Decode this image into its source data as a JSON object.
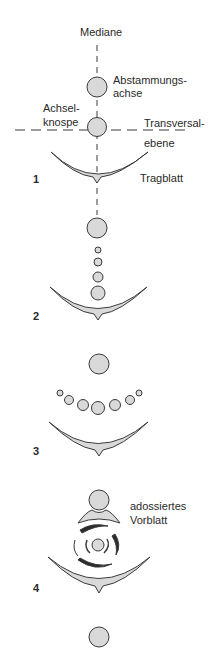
{
  "diagram": {
    "colors": {
      "stroke": "#3a3a3a",
      "fill": "#d9d9d9",
      "background": "#ffffff"
    },
    "labels": {
      "mediane": "Mediane",
      "abstammungsachse_1": "Abstammungs-",
      "abstammungsachse_2": "achse",
      "achselknospe_1": "Achsel-",
      "achselknospe_2": "knospe",
      "transversalebene_1": "Transversal-",
      "transversalebene_2": "ebene",
      "tragblatt": "Tragblatt",
      "adossiertes_vorblatt_1": "adossiertes",
      "adossiertes_vorblatt_2": "Vorblatt"
    },
    "panels": [
      {
        "number": "1"
      },
      {
        "number": "2"
      },
      {
        "number": "3"
      },
      {
        "number": "4"
      }
    ]
  }
}
